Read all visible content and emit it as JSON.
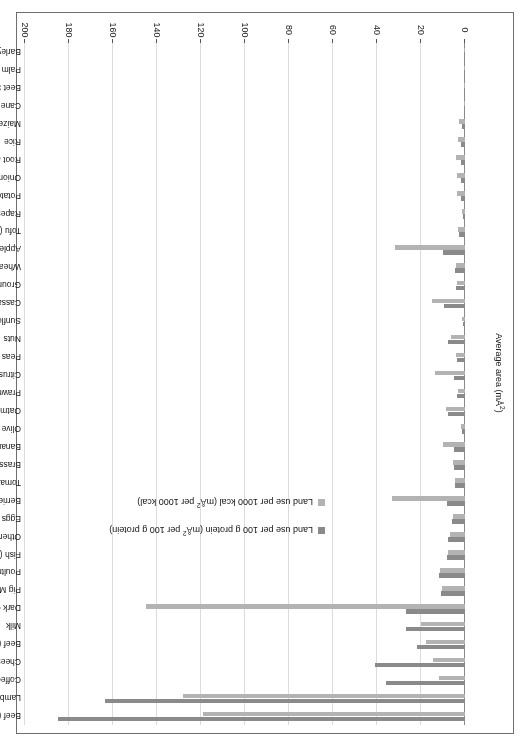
{
  "chart_data": {
    "type": "bar",
    "orientation": "horizontal",
    "grouped": true,
    "title": "",
    "xlabel": "Average area (mÅ²)",
    "ylabel": "",
    "xlim": [
      0,
      200
    ],
    "xticks": [
      0,
      20,
      40,
      60,
      80,
      100,
      120,
      140,
      160,
      180,
      200
    ],
    "grid": true,
    "legend_position": "inside-center",
    "legend": [
      {
        "name": "Land use per 100 g protein (mÅ² per 100 g protein)",
        "color": "#8a8a8a"
      },
      {
        "name": "Land use per 1000 kcal (mÅ² per 1000 kcal)",
        "color": "#b3b3b3"
      }
    ],
    "categories": [
      "Beef (beef herd)",
      "Lamb & Mutton",
      "Coffee",
      "Cheese",
      "Beef (dairy herd)",
      "Milk",
      "Dark Chocolate",
      "Pig Meat",
      "Poultry Meat",
      "Fish (farmed)",
      "Other Pulses",
      "Eggs",
      "Berries & Grapes",
      "Tomatoes",
      "Brassicas",
      "Bananas",
      "Olive Oil",
      "Oatmeal",
      "Prawns (farmed)",
      "Citrus Fruit",
      "Peas",
      "Nuts",
      "Sunflower Oil",
      "Cassava",
      "Groundnuts",
      "Wheat & Rye",
      "Apples",
      "Tofu (soybeans)",
      "Rapeseed Oil",
      "Potatoes",
      "Onions & Leeks",
      "Root and Vegetables",
      "Rice",
      "Maize",
      "Cane Sugar",
      "Beet Sugar",
      "Palm Oil",
      "Barley"
    ],
    "series": [
      {
        "name": "Land use per 100 g protein (mÅ² per 100 g protein)",
        "color": "#8a8a8a",
        "values": [
          185.0,
          163.5,
          36.0,
          41.0,
          22.0,
          27.0,
          27.0,
          11.0,
          12.0,
          8.0,
          7.5,
          6.0,
          8.0,
          4.5,
          5.0,
          5.0,
          1.5,
          7.5,
          3.5,
          5.0,
          3.5,
          7.5,
          1.0,
          9.5,
          4.0,
          4.5,
          10.0,
          2.5,
          1.0,
          2.0,
          2.0,
          2.0,
          2.0,
          1.5,
          0.4,
          0.4,
          0.3,
          0.3
        ]
      },
      {
        "name": "Land use per 1000 kcal (mÅ² per 1000 kcal)",
        "color": "#b3b3b3",
        "values": [
          119.0,
          128.0,
          12.0,
          14.5,
          17.5,
          20.0,
          145.0,
          10.5,
          11.5,
          7.5,
          7.0,
          5.5,
          33.0,
          4.5,
          5.5,
          10.0,
          2.0,
          8.5,
          3.0,
          13.5,
          4.0,
          6.5,
          1.5,
          15.0,
          3.5,
          4.0,
          32.0,
          3.0,
          1.2,
          3.5,
          3.5,
          4.0,
          3.0,
          2.5,
          0.6,
          0.6,
          0.4,
          0.5
        ]
      }
    ]
  },
  "axis": {
    "y_title": "Average area (mÅ²)",
    "tick_labels": [
      "0",
      "20",
      "40",
      "60",
      "80",
      "100",
      "120",
      "140",
      "160",
      "180",
      "200"
    ]
  },
  "legend": {
    "items": [
      {
        "label_prefix": "Land use per 100 g protein (m",
        "label_sup": "2",
        "label_suffix": " per 100 g protein)"
      },
      {
        "label_prefix": "Land use per 1000 kcal (m",
        "label_sup": "2",
        "label_suffix": " per 1000 kcal)"
      }
    ],
    "item0_full": "Land use per 100 g protein (mÅ² per 100 g protein)",
    "item1_full": "Land use per 1000 kcal (mÅ² per 1000 kcal)"
  }
}
